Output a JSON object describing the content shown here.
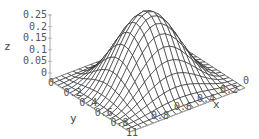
{
  "chart_data": {
    "type": "surface3d",
    "title": "",
    "function_shape": "single smooth bell-shaped bump peaking at the center of the unit square",
    "x": {
      "label": "x",
      "range": [
        0,
        1
      ],
      "ticks": [
        "0",
        "0.2",
        "0.4",
        "0.6",
        "0.8",
        "1"
      ]
    },
    "y": {
      "label": "y",
      "range": [
        0,
        1
      ],
      "ticks": [
        "0",
        "0.2",
        "0.4",
        "0.6",
        "0.8",
        "1"
      ]
    },
    "z": {
      "label": "z",
      "range": [
        0,
        0.25
      ],
      "ticks": [
        "0",
        "0.05",
        "0.1",
        "0.15",
        "0.2",
        "0.25"
      ]
    },
    "peak": {
      "x": 0.5,
      "y": 0.5,
      "z": 0.25
    },
    "mesh": {
      "grid_lines_per_axis": 20,
      "style": "wireframe",
      "line_color": "#222222",
      "fill_color": "#ffffff"
    },
    "box": false,
    "grid": false
  }
}
